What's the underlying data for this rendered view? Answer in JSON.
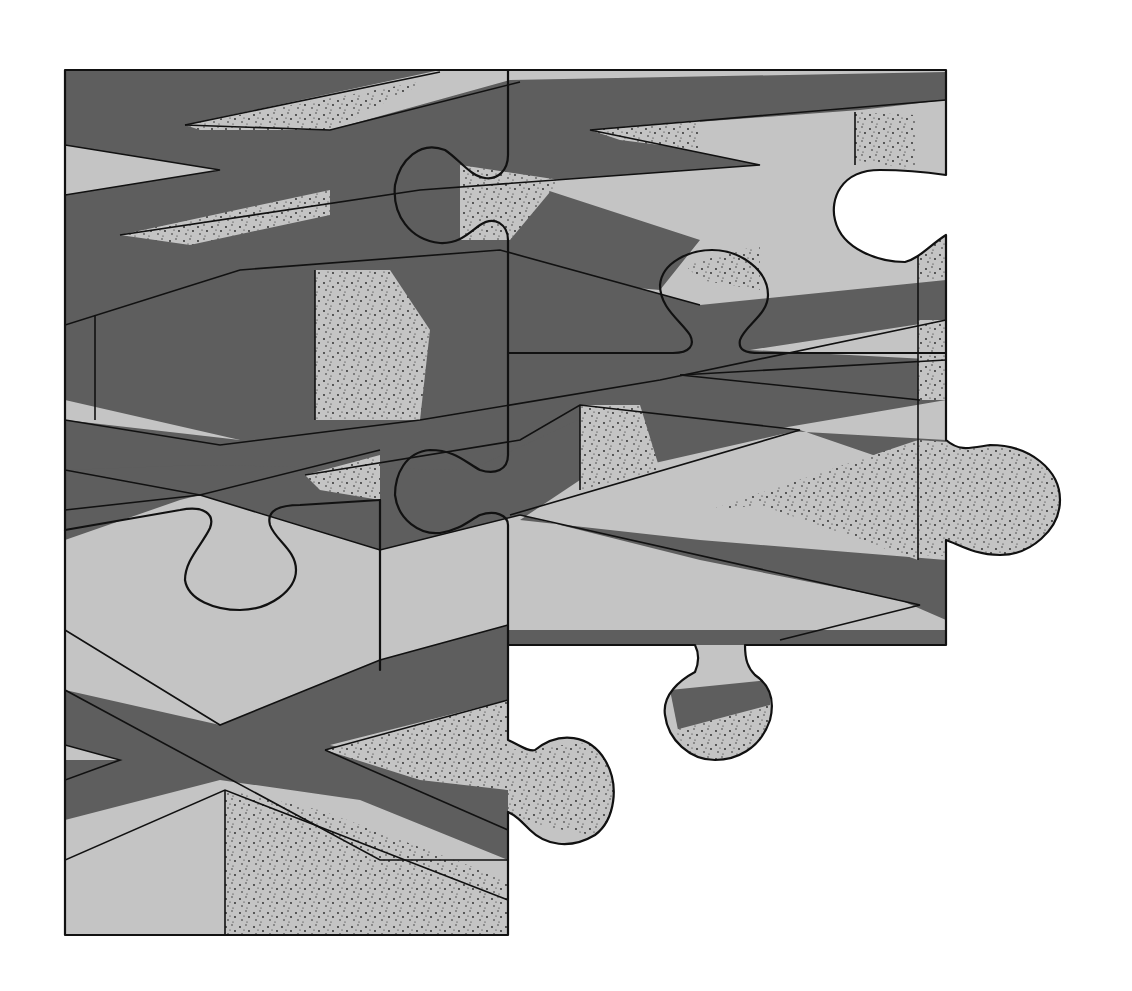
{
  "image": {
    "description": "Illustration of interlocking jigsaw puzzle pieces forming an impossible-geometry pattern of dark gray bands and light gray blocks with stippled shading",
    "colors": {
      "background": "#ffffff",
      "dark_band": "#5e5e5e",
      "light_face": "#c4c4c4",
      "outline": "#111111"
    }
  }
}
